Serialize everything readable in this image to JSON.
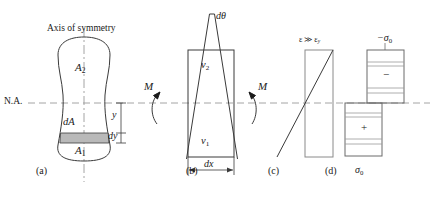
{
  "figure": {
    "title_note": "Plastic bending of a beam: cross-section, curvature, strain and stress distributions",
    "na_label": "N.A.",
    "axis_label": "Axis of symmetry"
  },
  "panel_a": {
    "caption": "(a)",
    "area_upper": "A",
    "area_upper_sub": "2",
    "area_lower": "A",
    "area_lower_sub": "1",
    "strip_label": "dA",
    "dim_y": "y",
    "dim_dy": "dy"
  },
  "panel_b": {
    "caption": "(b)",
    "dtheta": "dθ",
    "nu_upper": "v",
    "nu_upper_sub": "2",
    "nu_lower": "v",
    "nu_lower_sub": "1",
    "dim_dx": "dx",
    "moment_left": "M",
    "moment_right": "M"
  },
  "panel_c": {
    "caption": "(c)",
    "strain_note": "ε ≫ ε",
    "strain_note_sub": "y"
  },
  "panel_d": {
    "caption": "(d)",
    "stress_top": "−σ",
    "stress_top_sub": "0",
    "stress_bottom": "σ",
    "stress_bottom_sub": "0",
    "sign_compression": "−",
    "sign_tension": "+"
  },
  "style": {
    "ink": "#1a1a1a",
    "line": "#3a3a3a",
    "dash": "#9a9a9a",
    "shade": "#b9b9b9"
  }
}
